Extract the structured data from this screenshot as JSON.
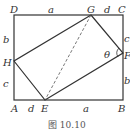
{
  "figure": {
    "caption": "图 10.10",
    "points": {
      "A": "A",
      "B": "B",
      "C": "C",
      "D": "D",
      "E": "E",
      "F": "F",
      "G": "G",
      "H": "H"
    },
    "segments": {
      "DG": "a",
      "GC": "d",
      "CF": "c",
      "FB": "b",
      "BE": "a",
      "EA": "d",
      "AH": "c",
      "HD": "b"
    },
    "angle": "θ"
  }
}
